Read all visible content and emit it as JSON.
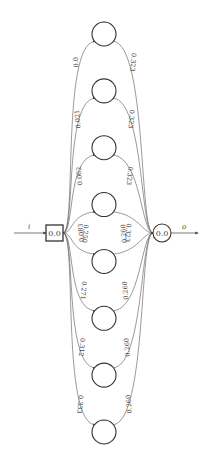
{
  "diagram": {
    "input_node": {
      "label": "0.0",
      "shape": "square"
    },
    "output_node": {
      "label": "0.0",
      "shape": "circle"
    },
    "input_arrow_label": "i",
    "output_arrow_label": "o",
    "hidden_nodes": [
      {
        "id": 1,
        "label": ""
      },
      {
        "id": 2,
        "label": ""
      },
      {
        "id": 3,
        "label": ""
      },
      {
        "id": 4,
        "label": ""
      },
      {
        "id": 5,
        "label": ""
      },
      {
        "id": 6,
        "label": ""
      },
      {
        "id": 7,
        "label": ""
      },
      {
        "id": 8,
        "label": ""
      }
    ],
    "in_edges": [
      {
        "to": 1,
        "weight": "0.0"
      },
      {
        "to": 2,
        "weight": "0.021"
      },
      {
        "to": 3,
        "weight": "0.062"
      },
      {
        "to": 4,
        "weight": "0.083"
      },
      {
        "to": 5,
        "weight": "0.250"
      },
      {
        "to": 6,
        "weight": "0.271"
      },
      {
        "to": 7,
        "weight": "0.312"
      },
      {
        "to": 8,
        "weight": "0.333"
      }
    ],
    "out_edges": [
      {
        "from": 1,
        "weight": "0.323"
      },
      {
        "from": 2,
        "weight": "0.323"
      },
      {
        "from": 3,
        "weight": "0.323"
      },
      {
        "from": 4,
        "weight": "0.323"
      },
      {
        "from": 5,
        "weight": "0.260"
      },
      {
        "from": 6,
        "weight": "0.260"
      },
      {
        "from": 7,
        "weight": "0.260"
      },
      {
        "from": 8,
        "weight": "0.260"
      }
    ]
  }
}
